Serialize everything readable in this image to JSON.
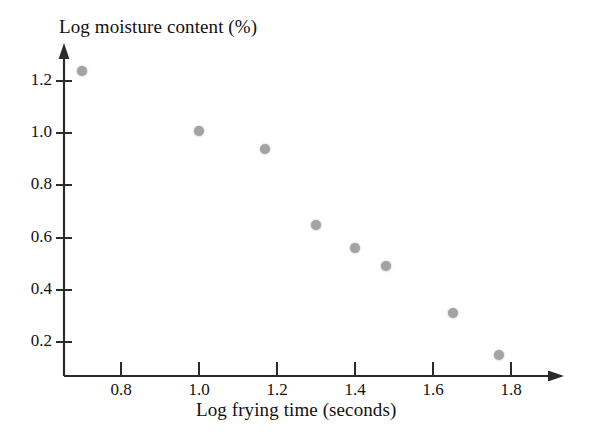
{
  "chart_data": {
    "type": "scatter",
    "title": "",
    "xlabel": "Log frying time (seconds)",
    "ylabel": "Log moisture content (%)",
    "xlim": [
      0.64,
      1.86
    ],
    "ylim": [
      0.09,
      1.3
    ],
    "xticks": [
      "0.8",
      "1.0",
      "1.2",
      "1.4",
      "1.6",
      "1.8"
    ],
    "yticks": [
      "1.2",
      "1.0",
      "0.8",
      "0.6",
      "0.4",
      "0.2"
    ],
    "grid": false,
    "legend": null,
    "marker_color": "#a3a3a3",
    "axis_color": "#2b2b2b",
    "x": [
      0.7,
      1.0,
      1.17,
      1.3,
      1.4,
      1.48,
      1.65,
      1.77
    ],
    "y": [
      1.24,
      1.01,
      0.94,
      0.65,
      0.56,
      0.49,
      0.31,
      0.15
    ],
    "points": [
      {
        "x": 0.7,
        "y": 1.24
      },
      {
        "x": 1.0,
        "y": 1.01
      },
      {
        "x": 1.17,
        "y": 0.94
      },
      {
        "x": 1.3,
        "y": 0.65
      },
      {
        "x": 1.4,
        "y": 0.56
      },
      {
        "x": 1.48,
        "y": 0.49
      },
      {
        "x": 1.65,
        "y": 0.31
      },
      {
        "x": 1.77,
        "y": 0.15
      }
    ]
  },
  "axes": {
    "y_title": "Log moisture content (%)",
    "x_title": "Log frying time (seconds)",
    "y_tick_labels": [
      "1.2",
      "1.0",
      "0.8",
      "0.6",
      "0.4",
      "0.2"
    ],
    "x_tick_labels": [
      "0.8",
      "1.0",
      "1.2",
      "1.4",
      "1.6",
      "1.8"
    ]
  }
}
